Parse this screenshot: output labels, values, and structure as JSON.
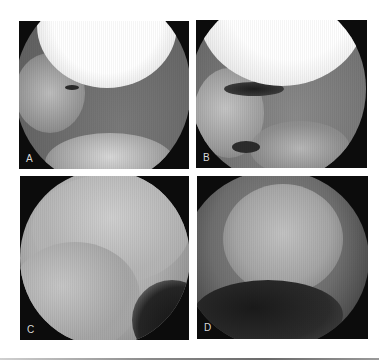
{
  "figure": {
    "panels": [
      {
        "id": "A",
        "label": "A",
        "description": "Arthroscopic view with bright overexposed condyle at top and grey soft tissue below"
      },
      {
        "id": "B",
        "label": "B",
        "description": "Arthroscopic view with bright dome above a dark crescent cleft and grey tissue"
      },
      {
        "id": "C",
        "label": "C",
        "description": "Arthroscopic view of smooth pale articular surfaces with fold at left"
      },
      {
        "id": "D",
        "label": "D",
        "description": "Arthroscopic view of rounded cartilage surface with dark lower region"
      }
    ]
  }
}
